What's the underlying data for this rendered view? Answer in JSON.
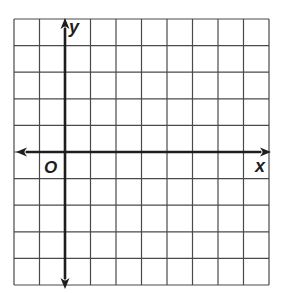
{
  "diagram": {
    "type": "coordinate-plane",
    "grid": {
      "left": 14,
      "top": 19,
      "right": 269,
      "bottom": 285,
      "columns": 10,
      "rows": 10,
      "line_color": "#4a4a4a",
      "line_width": 1.2
    },
    "origin": {
      "column": 2,
      "row": 5
    },
    "axes": {
      "color": "#1e1e1e",
      "width": 2.6,
      "x_axis": {
        "label": "x",
        "arrows": [
          "left",
          "right"
        ],
        "left_end": 16,
        "right_end": 271
      },
      "y_axis": {
        "label": "y",
        "arrows": [
          "up",
          "down"
        ],
        "top_end": 18,
        "bottom_end": 289
      }
    },
    "origin_label": "O",
    "background": "#ffffff"
  }
}
